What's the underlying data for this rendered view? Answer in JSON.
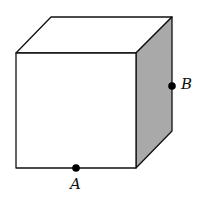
{
  "diagram": {
    "type": "cube",
    "colors": {
      "line": "#111111",
      "front_face": "#ffffff",
      "top_face": "#ffffff",
      "right_face": "#a9a9a9",
      "point": "#000000"
    },
    "points": [
      {
        "id": "A",
        "label": "A",
        "location": "midpoint of front bottom edge"
      },
      {
        "id": "B",
        "label": "B",
        "location": "midpoint of back right vertical edge"
      }
    ]
  }
}
